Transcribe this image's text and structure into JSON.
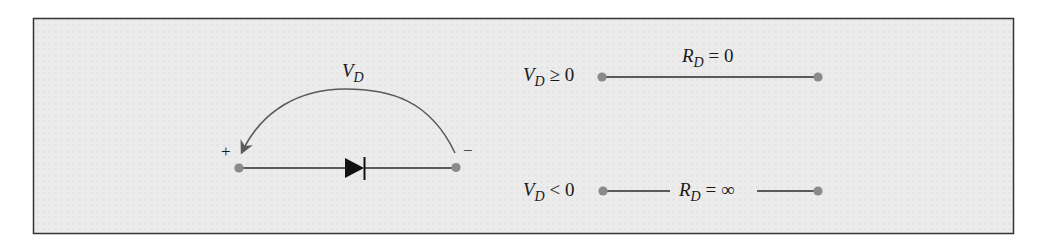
{
  "figure": {
    "panel": {
      "fill": "#ebebeb",
      "border": "#333333"
    },
    "diode_circuit": {
      "voltage_label": {
        "var": "V",
        "sub": "D"
      },
      "plus_sign": "+",
      "minus_sign": "−",
      "colors": {
        "wire": "#2a2a2a",
        "terminal": "#8a8a8a",
        "arc": "#5a5a5a",
        "diode": "#111111"
      }
    },
    "models": [
      {
        "condition": {
          "var": "V",
          "sub": "D",
          "rel": " ≥ 0"
        },
        "resistance": {
          "var": "R",
          "sub": "D",
          "rel": " = 0"
        },
        "state": "short circuit"
      },
      {
        "condition": {
          "var": "V",
          "sub": "D",
          "rel": " < 0"
        },
        "resistance": {
          "var": "R",
          "sub": "D",
          "rel": " = ∞"
        },
        "state": "open circuit"
      }
    ]
  }
}
